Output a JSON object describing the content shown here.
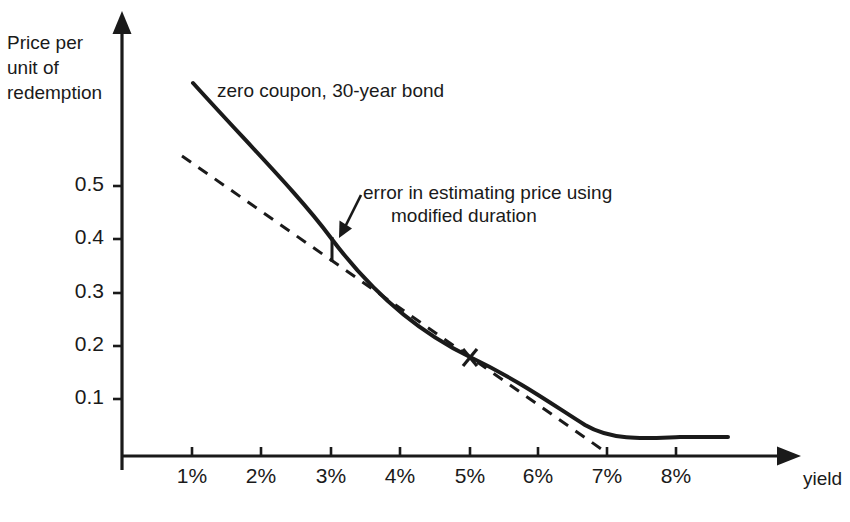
{
  "chart_data": {
    "type": "line",
    "title": "",
    "xlabel": "yield",
    "ylabel": "Price per\nunit of\nredemption",
    "ylabel_lines": [
      "Price per",
      "unit of",
      "redemption"
    ],
    "xticks": [
      "1%",
      "2%",
      "3%",
      "4%",
      "5%",
      "6%",
      "7%",
      "8%"
    ],
    "xtick_values": [
      1,
      2,
      3,
      4,
      5,
      6,
      7,
      8
    ],
    "yticks": [
      "0.1",
      "0.2",
      "0.3",
      "0.4",
      "0.5"
    ],
    "ytick_values": [
      0.1,
      0.2,
      0.3,
      0.4,
      0.5
    ],
    "xlim": [
      0,
      9.8
    ],
    "ylim": [
      0,
      0.68
    ],
    "grid": false,
    "legend_position": "inline-annotation",
    "series": [
      {
        "name": "zero coupon, 30-year bond",
        "style": "solid",
        "color": "#1a1a1a",
        "x": [
          1.02,
          1.5,
          2.0,
          2.5,
          3.0,
          3.5,
          4.0,
          4.5,
          5.0,
          5.5,
          6.0,
          6.5,
          7.0,
          7.5,
          8.0,
          8.5,
          8.78
        ],
        "y": [
          0.601,
          0.533,
          0.472,
          0.419,
          0.372,
          0.331,
          0.295,
          0.263,
          0.235,
          0.21,
          0.188,
          0.169,
          0.152,
          0.14,
          0.132,
          0.129,
          0.131
        ]
      },
      {
        "name": "modified duration estimate",
        "style": "dashed",
        "color": "#1a1a1a",
        "x": [
          0.86,
          5.0,
          7.0
        ],
        "y": [
          0.552,
          0.235,
          0.0
        ]
      }
    ],
    "markers": [
      {
        "name": "tangency-point",
        "glyph": "x",
        "x": 5.0,
        "y": 0.235
      }
    ],
    "annotations": [
      {
        "name": "series-label",
        "text": "zero coupon, 30-year bond"
      },
      {
        "name": "error-annotation",
        "lines": [
          "error in estimating price using",
          "modified duration"
        ],
        "arrow": true,
        "points_to_x": 3.0,
        "points_to_y": 0.39
      },
      {
        "name": "error-bar",
        "x": 3.0,
        "y_top": 0.402,
        "y_bottom": 0.36
      }
    ],
    "axis_style": {
      "arrow_heads": true,
      "spine_color": "#1a1a1a",
      "background": "#ffffff"
    }
  }
}
